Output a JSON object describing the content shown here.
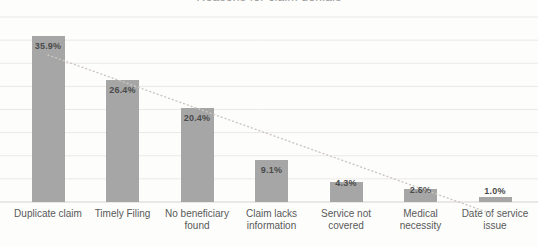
{
  "chart_data": {
    "type": "bar",
    "title": "Reasons for claim denials",
    "categories": [
      "Duplicate claim",
      "Timely Filing",
      "No beneficiary\nfound",
      "Claim lacks\ninformation",
      "Service not\ncovered",
      "Medical\nnecessity",
      "Date of service\nissue"
    ],
    "values": [
      35.9,
      26.4,
      20.4,
      9.1,
      4.3,
      2.8,
      1.0
    ],
    "data_labels": [
      "35.9%",
      "26.4%",
      "20.4%",
      "9.1%",
      "4.3%",
      "2.8%",
      "1.0%"
    ],
    "ylabel": "",
    "xlabel": "",
    "ylim": [
      0,
      40
    ],
    "gridline_interval": 5,
    "grid": true,
    "legend": "none",
    "yaxis_labels_visible": false,
    "trendline": {
      "type": "linear",
      "style": "dotted"
    }
  },
  "colors": {
    "bar": "#a6a6a6",
    "data_label": "#4b4b4b",
    "category_label": "#595959",
    "gridline": "#ebe9e7",
    "axis_line": "#d5d3d1",
    "trendline": "#cdc7c1",
    "background": "#fdfdfc",
    "title": "#9a9a9a"
  }
}
